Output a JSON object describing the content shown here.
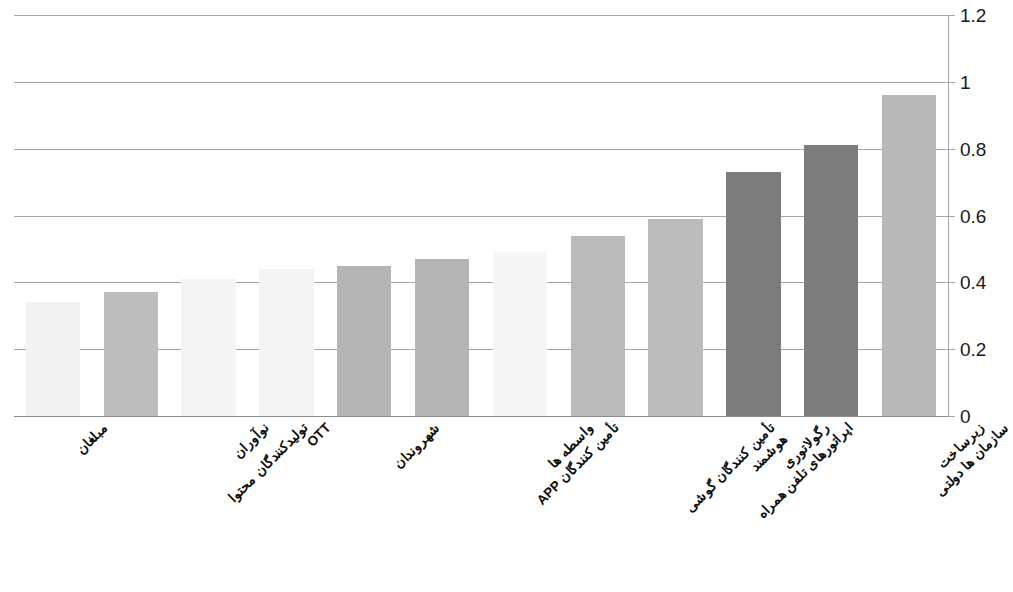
{
  "chart_data": {
    "type": "bar",
    "title": "",
    "subtitle": "",
    "xlabel": "",
    "ylabel": "",
    "ylim": [
      0,
      1.2
    ],
    "y_ticks": [
      "0",
      "0.2",
      "0.4",
      "0.6",
      "0.8",
      "1",
      "1.2"
    ],
    "y_tick_values": [
      0,
      0.2,
      0.4,
      0.6,
      0.8,
      1.0,
      1.2
    ],
    "grid": true,
    "legend": "none",
    "categories": [
      "مبلغان",
      "تولیدکنندگان محتوا",
      "نوآوران",
      "OTT",
      "شهروندان",
      "تأمین کنندگان APP",
      "واسطه ها",
      "تأمین کنندگان گوشی هوشمند",
      "اپراتورهای تلفن همراه",
      "رگولاتوری",
      "سازمان ها دولتی",
      "زیرساخت"
    ],
    "values": [
      0.34,
      0.37,
      0.41,
      0.44,
      0.45,
      0.47,
      0.49,
      0.54,
      0.59,
      0.73,
      0.81,
      0.96
    ],
    "bar_colors": [
      "#f2f2f2",
      "#bdbdbd",
      "#f4f4f4",
      "#f4f4f4",
      "#b4b4b4",
      "#b4b4b4",
      "#f5f5f5",
      "#b9b9b9",
      "#bcbcbc",
      "#7c7c7c",
      "#7c7c7c",
      "#b8b8b8"
    ]
  },
  "axis": {
    "gridline_color": "#a6a6a6",
    "label_color": "#1a1a1a"
  }
}
